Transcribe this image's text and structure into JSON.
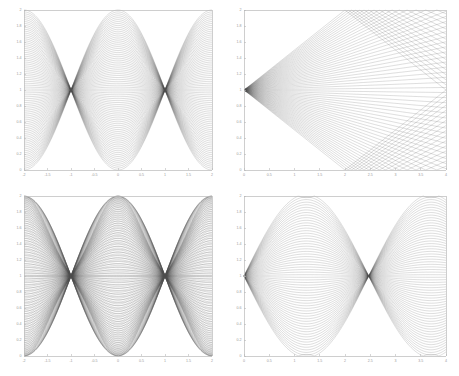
{
  "figure": {
    "title": "",
    "background": "#ffffff",
    "curve_color": "#4a4a4a",
    "axis_color": "#b9b9b9",
    "label_color": "#9a9a9a",
    "layout": "2x2 grid of line-family envelope plots"
  },
  "chart_data": [
    {
      "id": "top-left",
      "type": "line",
      "title": "",
      "xlabel": "",
      "ylabel": "",
      "xlim": [
        -2,
        2
      ],
      "ylim": [
        0,
        2
      ],
      "grid": false,
      "legend": null,
      "xticks": [
        -2,
        -1.5,
        -1,
        -0.5,
        0,
        0.5,
        1,
        1.5,
        2
      ],
      "xticklabels": [
        "-2",
        "-1.5",
        "-1",
        "-0.5",
        "0",
        "0.5",
        "1",
        "1.5",
        "2"
      ],
      "yticks": [
        0,
        0.2,
        0.4,
        0.6,
        0.8,
        1,
        1.2,
        1.4,
        1.6,
        1.8,
        2
      ],
      "yticklabels": [
        "0",
        "0.2",
        "0.4",
        "0.6",
        "0.8",
        "1",
        "1.2",
        "1.4",
        "1.6",
        "1.8",
        "2"
      ],
      "family": "chirp-straight",
      "n_curves": 84,
      "description": "Family of near-straight lines pivoting about y=1 forming lens/caustic cusps at x=-2,0,2"
    },
    {
      "id": "top-right",
      "type": "line",
      "title": "",
      "xlabel": "",
      "ylabel": "",
      "xlim": [
        0,
        4
      ],
      "ylim": [
        0,
        2
      ],
      "grid": false,
      "legend": null,
      "xticks": [
        0,
        0.5,
        1,
        1.5,
        2,
        2.5,
        3,
        3.5,
        4
      ],
      "xticklabels": [
        "0",
        "0.5",
        "1",
        "1.5",
        "2",
        "2.5",
        "3",
        "3.5",
        "4"
      ],
      "yticks": [
        0,
        0.2,
        0.4,
        0.6,
        0.8,
        1,
        1.2,
        1.4,
        1.6,
        1.8,
        2
      ],
      "yticklabels": [
        "0",
        "0.2",
        "0.4",
        "0.6",
        "0.8",
        "1",
        "1.2",
        "1.4",
        "1.6",
        "1.8",
        "2"
      ],
      "family": "straight-pencil",
      "n_curves": 64,
      "description": "Pencil of straight lines from (0,1) to (4, t) producing diamond/X crossing nodes at x=2, y=0.54 and y=1.46"
    },
    {
      "id": "bottom-left",
      "type": "line",
      "title": "",
      "xlabel": "",
      "ylabel": "",
      "xlim": [
        -2,
        2
      ],
      "ylim": [
        0,
        2
      ],
      "grid": false,
      "legend": null,
      "xticks": [
        -2,
        -1.5,
        -1,
        -0.5,
        0,
        0.5,
        1,
        1.5,
        2
      ],
      "xticklabels": [
        "-2",
        "-1.5",
        "-1",
        "-0.5",
        "0",
        "0.5",
        "1",
        "1.5",
        "2"
      ],
      "yticks": [
        0,
        0.2,
        0.4,
        0.6,
        0.8,
        1,
        1.2,
        1.4,
        1.6,
        1.8,
        2
      ],
      "yticklabels": [
        "0",
        "0.2",
        "0.4",
        "0.6",
        "0.8",
        "1",
        "1.2",
        "1.4",
        "1.6",
        "1.8",
        "2"
      ],
      "family": "sinusoidal-envelope",
      "n_curves": 84,
      "description": "Family of smooth sinusoidal curves with envelope waists near x=-1 and x=+1 and bulges at x=-2,0,2"
    },
    {
      "id": "bottom-right",
      "type": "line",
      "title": "",
      "xlabel": "",
      "ylabel": "",
      "xlim": [
        0,
        4
      ],
      "ylim": [
        0,
        2
      ],
      "grid": false,
      "legend": null,
      "xticks": [
        0,
        0.5,
        1,
        1.5,
        2,
        2.5,
        3,
        3.5,
        4
      ],
      "xticklabels": [
        "0",
        "0.5",
        "1",
        "1.5",
        "2",
        "2.5",
        "3",
        "3.5",
        "4"
      ],
      "yticks": [
        0,
        0.2,
        0.4,
        0.6,
        0.8,
        1,
        1.2,
        1.4,
        1.6,
        1.8,
        2
      ],
      "yticklabels": [
        "0",
        "0.2",
        "0.4",
        "0.6",
        "0.8",
        "1",
        "1.2",
        "1.4",
        "1.6",
        "1.8",
        "2"
      ],
      "family": "curved-pencil",
      "n_curves": 64,
      "description": "Pencil of curved arcs fanning from (0,1), pinching at x=1.46 (y=0.54 and y=1.46), reopening toward x=4"
    }
  ]
}
